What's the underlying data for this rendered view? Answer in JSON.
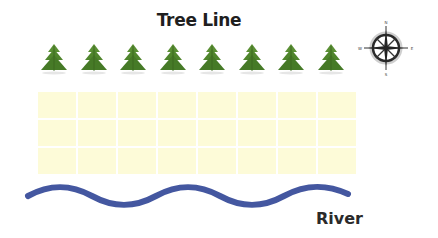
{
  "title": "Tree Line",
  "river_label": "River",
  "trees": {
    "count": 8,
    "color": "#4a7d2a",
    "icon": "pine-tree-icon"
  },
  "grid": {
    "columns": 8,
    "rows": 3,
    "fill": "#fdfbd8"
  },
  "compass": {
    "icon": "compass-rose-icon",
    "labels": {
      "north": "N",
      "south": "S",
      "east": "E",
      "west": "W"
    }
  },
  "river": {
    "color": "#4457a0",
    "icon": "river-wave"
  }
}
